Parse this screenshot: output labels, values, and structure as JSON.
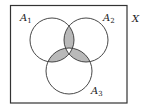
{
  "diagram": {
    "type": "venn",
    "universe": {
      "label": "X",
      "box": {
        "x": 10.5,
        "y": 5.5,
        "w": 116.5,
        "h": 97.5
      }
    },
    "sets": [
      {
        "name": "A",
        "sub": "1",
        "cx": 52,
        "cy": 40,
        "r": 22,
        "label_x": 20,
        "label_y": 21
      },
      {
        "name": "A",
        "sub": "2",
        "cx": 86,
        "cy": 40,
        "r": 22,
        "label_x": 103,
        "label_y": 21
      },
      {
        "name": "A",
        "sub": "3",
        "cx": 69,
        "cy": 71,
        "r": 23,
        "label_x": 91,
        "label_y": 94
      }
    ],
    "shaded_regions": [
      "A1∩A2 only",
      "A1∩A3 only",
      "A2∩A3 only"
    ],
    "unshaded_regions": [
      "A1∩A2∩A3"
    ],
    "colors": {
      "stroke": "#333333",
      "shade": "#b9b9b9",
      "background": "#ffffff"
    }
  }
}
